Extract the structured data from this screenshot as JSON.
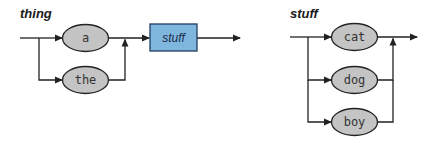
{
  "diagrams": [
    {
      "title": "thing",
      "choices": [
        {
          "label": "a",
          "kind": "terminal"
        },
        {
          "label": "the",
          "kind": "terminal"
        }
      ],
      "next": {
        "label": "stuff",
        "kind": "nonterminal"
      }
    },
    {
      "title": "stuff",
      "choices": [
        {
          "label": "cat",
          "kind": "terminal"
        },
        {
          "label": "dog",
          "kind": "terminal"
        },
        {
          "label": "boy",
          "kind": "terminal"
        }
      ]
    }
  ],
  "colors": {
    "terminal_fill": "#c4c4c4",
    "nonterminal_fill": "#7fb6de",
    "line": "#222222"
  }
}
